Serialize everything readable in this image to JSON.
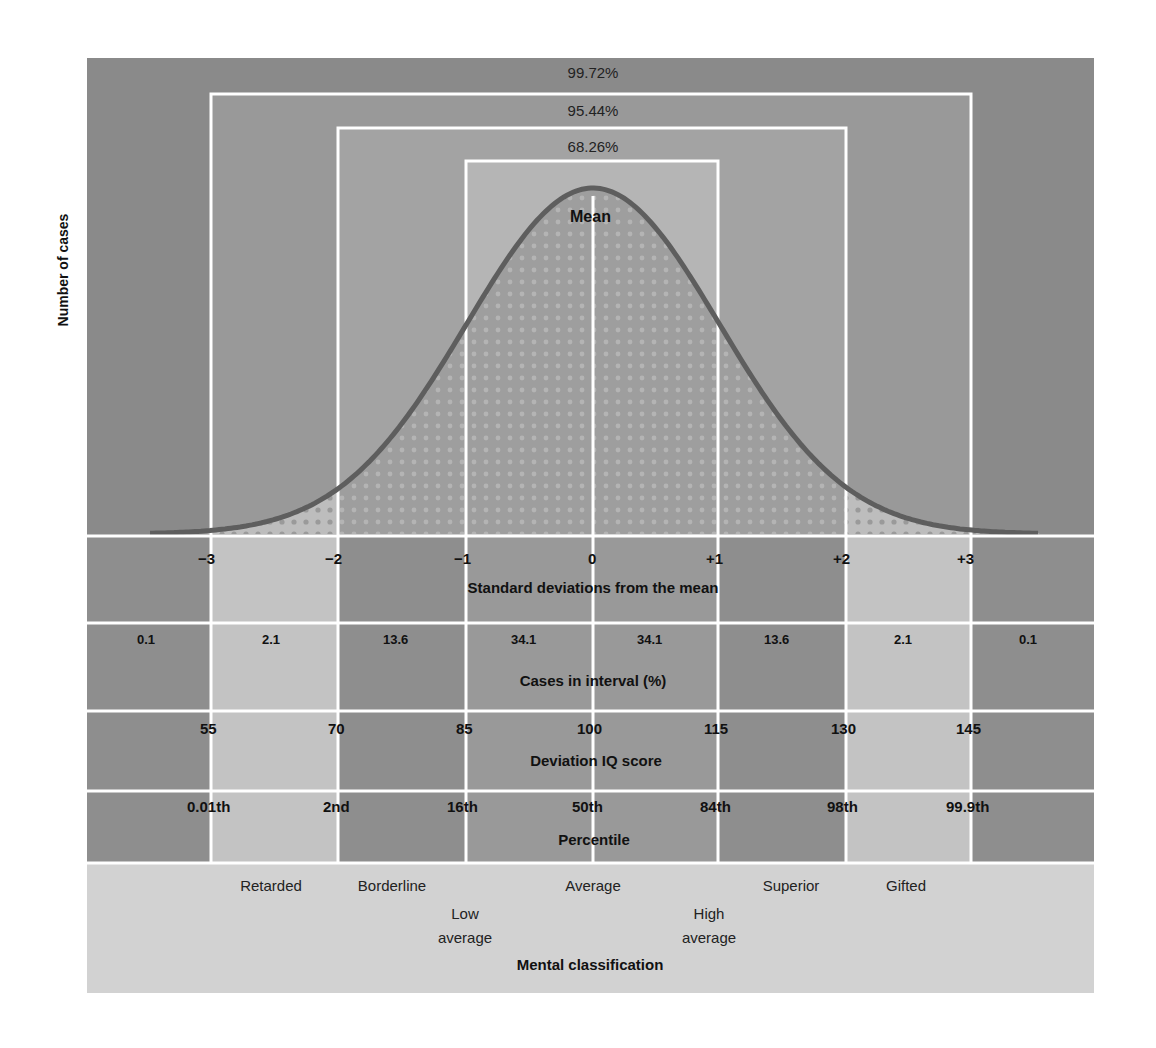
{
  "chart_data": {
    "type": "area",
    "ylabel": "Number of cases",
    "xlabel": "Standard deviations from the mean",
    "grid": true,
    "curve": "normal (bell) curve, mean 0, sd 1",
    "mean_label": "Mean",
    "coverage_brackets": [
      {
        "range": [
          -1,
          1
        ],
        "label": "68.26%"
      },
      {
        "range": [
          -2,
          2
        ],
        "label": "95.44%"
      },
      {
        "range": [
          -3,
          3
        ],
        "label": "99.72%"
      }
    ],
    "sd_ticks": [
      "−3",
      "−2",
      "−1",
      "0",
      "+1",
      "+2",
      "+3"
    ],
    "sd_values": [
      -3,
      -2,
      -1,
      0,
      1,
      2,
      3
    ],
    "rows": [
      {
        "title": "Standard deviations from the mean",
        "values": [
          "−3",
          "−2",
          "−1",
          "0",
          "+1",
          "+2",
          "+3"
        ]
      },
      {
        "title": "Cases in interval (%)",
        "intervals": [
          "<-3",
          "-3 to -2",
          "-2 to -1",
          "-1 to 0",
          "0 to +1",
          "+1 to +2",
          "+2 to +3",
          ">+3"
        ],
        "values": [
          0.1,
          2.1,
          13.6,
          34.1,
          34.1,
          13.6,
          2.1,
          0.1
        ]
      },
      {
        "title": "Deviation IQ score",
        "values": [
          55,
          70,
          85,
          100,
          115,
          130,
          145
        ]
      },
      {
        "title": "Percentile",
        "values": [
          "0.01th",
          "2nd",
          "16th",
          "50th",
          "84th",
          "98th",
          "99.9th"
        ]
      },
      {
        "title": "Mental classification",
        "values": [
          "Retarded",
          "Borderline",
          "Low average",
          "Average",
          "High average",
          "Superior",
          "Gifted"
        ]
      }
    ]
  },
  "figure": {
    "y_axis_label": "Number of cases",
    "mean_label": "Mean",
    "brackets": {
      "b99": "99.72%",
      "b95": "95.44%",
      "b68": "68.26%"
    },
    "sd_row": {
      "title": "Standard deviations from the mean",
      "ticks": [
        "−3",
        "−2",
        "−1",
        "0",
        "+1",
        "+2",
        "+3"
      ]
    },
    "cases_row": {
      "title": "Cases in interval (%)",
      "values": [
        "0.1",
        "2.1",
        "13.6",
        "34.1",
        "34.1",
        "13.6",
        "2.1",
        "0.1"
      ]
    },
    "iq_row": {
      "title": "Deviation IQ score",
      "values": [
        "55",
        "70",
        "85",
        "100",
        "115",
        "130",
        "145"
      ]
    },
    "percentile_row": {
      "title": "Percentile",
      "values": [
        "0.01th",
        "2nd",
        "16th",
        "50th",
        "84th",
        "98th",
        "99.9th"
      ]
    },
    "classification_row": {
      "title": "Mental classification",
      "labels": {
        "retarded": "Retarded",
        "borderline": "Borderline",
        "low_average_1": "Low",
        "low_average_2": "average",
        "average": "Average",
        "high_average_1": "High",
        "high_average_2": "average",
        "superior": "Superior",
        "gifted": "Gifted"
      }
    },
    "colors": {
      "outer": "#8a8a8a",
      "band3": "#9a9a9a",
      "band2": "#a6a6a6",
      "band1": "#b8b8b8",
      "curve_fill": "#8c8c8c",
      "curve_stroke": "#5e5e5e",
      "light_col": "#c4c4c4",
      "classification_bg": "#d2d2d2",
      "gridline": "#ffffff"
    }
  }
}
